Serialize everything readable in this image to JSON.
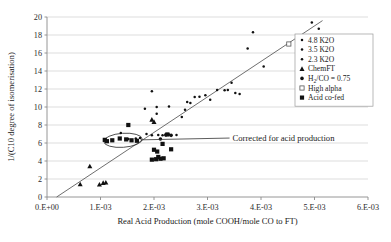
{
  "chart_data": {
    "type": "scatter",
    "title": "",
    "xlabel": "Real Acid Production (mole COOH/mole CO to FT)",
    "ylabel": "1/(C10 degree of isomerisation)",
    "xlim": [
      0,
      0.006
    ],
    "ylim": [
      0,
      20
    ],
    "grid": "horizontal",
    "xticklabels": [
      "0.E+00",
      "1.E-03",
      "2.E-03",
      "3.E-03",
      "4.E-03",
      "5.E-03",
      "6.E-03"
    ],
    "xtickvalues": [
      0,
      0.001,
      0.002,
      0.003,
      0.004,
      0.005,
      0.006
    ],
    "yticklabels": [
      "0",
      "2",
      "4",
      "6",
      "8",
      "10",
      "12",
      "14",
      "16",
      "18",
      "20"
    ],
    "ytickvalues": [
      0,
      2,
      4,
      6,
      8,
      10,
      12,
      14,
      16,
      18,
      20
    ],
    "legend_position": "upper-right",
    "trendline": {
      "x0": 0.00018,
      "y0": 0.0,
      "x1": 0.00515,
      "y1": 19.6
    },
    "annotations": [
      {
        "text": "Corrected for acid production",
        "x": 0.00345,
        "y": 6.55,
        "leader_from_x": 0.00175,
        "leader_from_y": 6.35
      }
    ],
    "highlight_ellipse": {
      "cx": 0.00142,
      "cy": 6.3,
      "rx": 0.00036,
      "ry": 0.78,
      "rotation": -4
    },
    "series": [
      {
        "name": "4.8 K2O",
        "marker": "dot",
        "filled": true,
        "points": [
          [
            0.00385,
            18.3
          ],
          [
            0.00375,
            16.5
          ],
          [
            0.00405,
            14.5
          ],
          [
            0.00495,
            19.4
          ],
          [
            0.00508,
            18.7
          ],
          [
            0.00345,
            12.7
          ],
          [
            0.00318,
            11.9
          ],
          [
            0.00332,
            11.85
          ],
          [
            0.00352,
            11.55
          ],
          [
            0.0036,
            11.45
          ]
        ]
      },
      {
        "name": "3.5 K2O",
        "marker": "dot",
        "filled": true,
        "points": [
          [
            0.00228,
            10.05
          ],
          [
            0.00205,
            10.0
          ],
          [
            0.00196,
            11.75
          ],
          [
            0.00183,
            9.8
          ],
          [
            0.00262,
            10.55
          ],
          [
            0.00276,
            11.1
          ],
          [
            0.00285,
            11.15
          ],
          [
            0.00296,
            11.3
          ],
          [
            0.00305,
            10.8
          ],
          [
            0.00338,
            11.9
          ],
          [
            0.00205,
            9.25
          ]
        ]
      },
      {
        "name": "2.3 K2O",
        "marker": "dot",
        "filled": true,
        "points": [
          [
            0.00138,
            7.1
          ],
          [
            0.00152,
            6.45
          ],
          [
            0.00186,
            7.0
          ],
          [
            0.00196,
            6.85
          ],
          [
            0.00208,
            6.9
          ],
          [
            0.00216,
            6.85
          ],
          [
            0.00228,
            6.95
          ],
          [
            0.00174,
            6.55
          ],
          [
            0.00242,
            6.9
          ],
          [
            0.00166,
            6.5
          ],
          [
            0.00252,
            8.9
          ],
          [
            0.00258,
            9.7
          ],
          [
            0.00268,
            10.45
          ]
        ]
      },
      {
        "name": "ChemFT",
        "marker": "triangle",
        "filled": true,
        "points": [
          [
            0.00062,
            1.42
          ],
          [
            0.0008,
            3.42
          ],
          [
            0.00098,
            1.4
          ],
          [
            0.00105,
            1.58
          ],
          [
            0.0011,
            1.62
          ],
          [
            0.00196,
            8.6
          ],
          [
            0.002,
            8.35
          ]
        ]
      },
      {
        "name": "H2/CO = 0.75",
        "marker": "circle",
        "filled": true,
        "points": [
          [
            0.00212,
            6.45
          ],
          [
            0.00222,
            6.9
          ],
          [
            0.00232,
            6.85
          ]
        ]
      },
      {
        "name": "High alpha",
        "marker": "square",
        "filled": false,
        "points": [
          [
            0.00452,
            17.0
          ]
        ]
      },
      {
        "name": "Acid co-fed",
        "marker": "square",
        "filled": true,
        "points": [
          [
            0.00108,
            6.35
          ],
          [
            0.00122,
            6.3
          ],
          [
            0.00136,
            6.5
          ],
          [
            0.00148,
            6.4
          ],
          [
            0.00158,
            6.3
          ],
          [
            0.00168,
            6.25
          ],
          [
            0.00152,
            8.0
          ],
          [
            0.00196,
            4.15
          ],
          [
            0.00204,
            4.2
          ],
          [
            0.00212,
            4.25
          ],
          [
            0.00208,
            4.45
          ],
          [
            0.00218,
            4.3
          ],
          [
            0.002,
            5.25
          ],
          [
            0.00206,
            5.05
          ],
          [
            0.00216,
            5.9
          ],
          [
            0.00232,
            5.3
          ],
          [
            0.00225,
            6.95
          ],
          [
            0.00112,
            6.2
          ]
        ]
      }
    ],
    "legend_entries": [
      {
        "label": "4.8 K2O",
        "marker": "dot"
      },
      {
        "label": "3.5 K2O",
        "marker": "dot"
      },
      {
        "label": "2.3 K2O",
        "marker": "dot"
      },
      {
        "label": "ChemFT",
        "marker": "triangle"
      },
      {
        "label": "H2/CO = 0.75",
        "marker": "circle",
        "rich": true
      },
      {
        "label": "High alpha",
        "marker": "square-open"
      },
      {
        "label": "Acid co-fed",
        "marker": "square-filled"
      }
    ],
    "colors": {
      "marker": "#111111",
      "trendline": "#555555",
      "grid": "#c8c8c8",
      "axis": "#8a8a8a",
      "text": "#1a1a1a"
    }
  }
}
